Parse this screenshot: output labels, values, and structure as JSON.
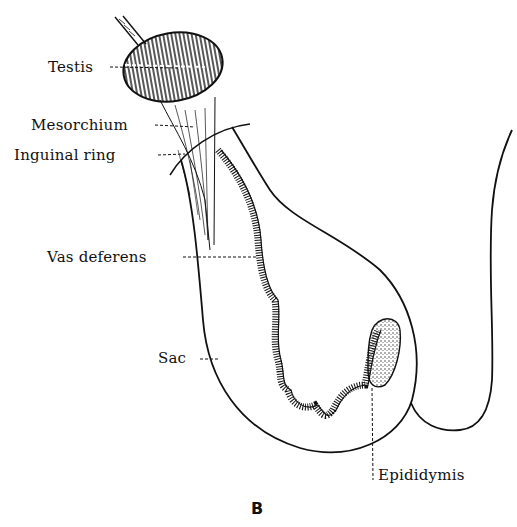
{
  "figure": {
    "panel_letter": "B",
    "stroke_color": "#111111",
    "background_color": "#ffffff"
  },
  "labels": {
    "testis": "Testis",
    "mesorchium": "Mesorchium",
    "inguinal_ring": "Inguinal ring",
    "vas_deferens": "Vas deferens",
    "sac": "Sac",
    "epididymis": "Epididymis"
  }
}
